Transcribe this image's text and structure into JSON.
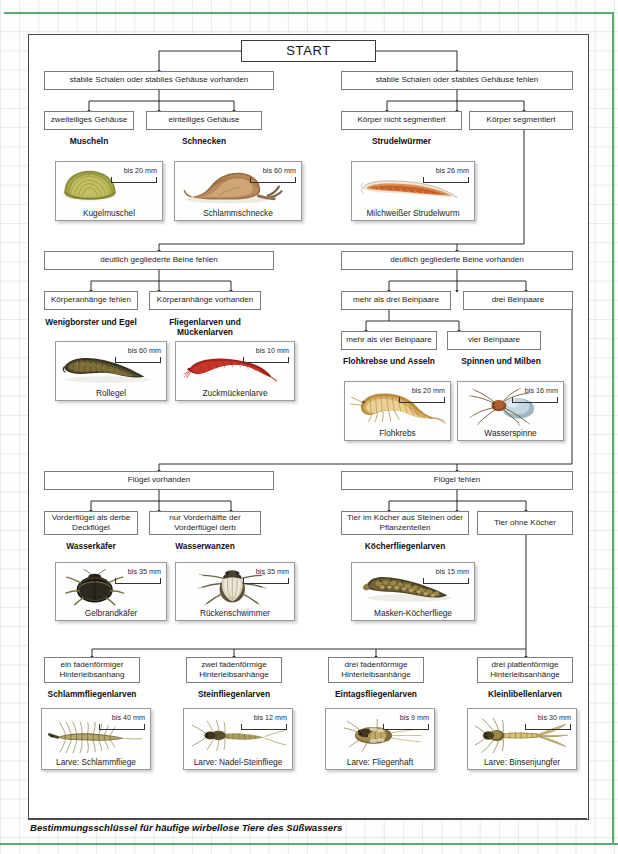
{
  "caption": "Bestimmungsschlüssel für häufige wirbellose Tiere des Süßwassers",
  "start": {
    "label": "START"
  },
  "colors": {
    "frame": "#5bab77",
    "box_border": "#7d7d7d",
    "panel_border": "#4a4a4a"
  },
  "level1": [
    {
      "label": "stabile Schalen oder stabiles Gehäuse vorhanden"
    },
    {
      "label": "stabile Schalen oder stabiles Gehäuse fehlen"
    }
  ],
  "level2": [
    {
      "label": "zweiteiliges Gehäuse"
    },
    {
      "label": "einteiliges Gehäuse"
    },
    {
      "label": "Körper nicht segmentiert"
    },
    {
      "label": "Körper segmentiert"
    }
  ],
  "groups1": [
    {
      "name": "Muscheln"
    },
    {
      "name": "Schnecken"
    },
    {
      "name": "Strudelwürmer"
    }
  ],
  "cards1": [
    {
      "scale": "bis 20 mm",
      "caption": "Kugelmuschel",
      "art": "mussel"
    },
    {
      "scale": "bis 60 mm",
      "caption": "Schlammschnecke",
      "art": "snail"
    },
    {
      "scale": "bis 26 mm",
      "caption": "Milchweißer Strudelwurm",
      "art": "flatworm"
    }
  ],
  "level3": [
    {
      "label": "deutlich gegliederte Beine fehlen"
    },
    {
      "label": "deutlich gegliederte Beine vorhanden"
    }
  ],
  "level4": [
    {
      "label": "Körperanhänge fehlen"
    },
    {
      "label": "Körperanhänge vorhanden"
    },
    {
      "label": "mehr als drei Beinpaare"
    },
    {
      "label": "drei Beinpaare"
    }
  ],
  "level5": [
    {
      "label": "mehr als vier Beinpaare"
    },
    {
      "label": "vier Beinpaare"
    }
  ],
  "groups2": [
    {
      "name": "Wenigborster und Egel"
    },
    {
      "name": "Fliegenlarven und Mückenlarven"
    },
    {
      "name": "Flohkrebse und Asseln"
    },
    {
      "name": "Spinnen und Milben"
    }
  ],
  "cards2": [
    {
      "scale": "bis 60 mm",
      "caption": "Rollegel",
      "art": "leech"
    },
    {
      "scale": "bis 10 mm",
      "caption": "Zuckmückenlarve",
      "art": "midge"
    },
    {
      "scale": "bis 20 mm",
      "caption": "Flohkrebs",
      "art": "amphipod"
    },
    {
      "scale": "bis 16 mm",
      "caption": "Wasserspinne",
      "art": "spider"
    }
  ],
  "level6": [
    {
      "label": "Flügel vorhanden"
    },
    {
      "label": "Flügel fehlen"
    }
  ],
  "level7": [
    {
      "label": "Vorderflügel als derbe Deckflügel"
    },
    {
      "label": "nur Vorderhälfte der Vorderflügel derb"
    },
    {
      "label": "Tier im Köcher aus Steinen oder Pflanzenteilen"
    },
    {
      "label": "Tier ohne Köcher"
    }
  ],
  "groups3": [
    {
      "name": "Wasserkäfer"
    },
    {
      "name": "Wasserwanzen"
    },
    {
      "name": "Köcherfliegenlarven"
    }
  ],
  "cards3": [
    {
      "scale": "bis 35 mm",
      "caption": "Gelbrandkäfer",
      "art": "beetle"
    },
    {
      "scale": "bis 35 mm",
      "caption": "Rückenschwimmer",
      "art": "backswimmer"
    },
    {
      "scale": "bis 15 mm",
      "caption": "Masken-Köcherfliege",
      "art": "caddis"
    }
  ],
  "level8": [
    {
      "label": "ein fadenförmiger Hinterleibsanhang"
    },
    {
      "label": "zwei fadenförmige Hinterleibsanhänge"
    },
    {
      "label": "drei fadenförmige Hinterleibsanhänge"
    },
    {
      "label": "drei plattenförmige Hinterleibsanhänge"
    }
  ],
  "groups4": [
    {
      "name": "Schlammfliegenlarven"
    },
    {
      "name": "Steinfliegenlarven"
    },
    {
      "name": "Eintagsfliegenlarven"
    },
    {
      "name": "Kleinlibellenlarven"
    }
  ],
  "cards4": [
    {
      "scale": "bis 40 mm",
      "caption": "Larve: Schlammfliege",
      "art": "alderfly"
    },
    {
      "scale": "bis 12 mm",
      "caption": "Larve: Nadel-Steinfliege",
      "art": "stonefly"
    },
    {
      "scale": "bis 9 mm",
      "caption": "Larve: Fliegenhaft",
      "art": "mayfly"
    },
    {
      "scale": "bis 30 mm",
      "caption": "Larve: Binsenjungfer",
      "art": "damselfly"
    }
  ]
}
